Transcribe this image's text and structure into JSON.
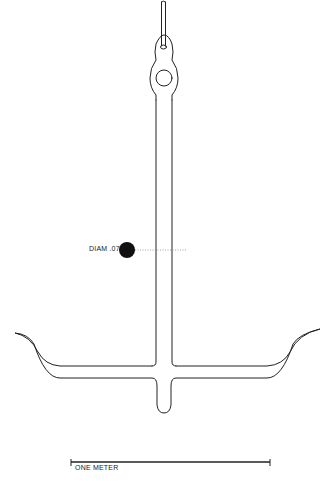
{
  "figure": {
    "line_color": "#222222",
    "background": "#ffffff"
  },
  "annotations": {
    "diameter_label": "DIAM .07",
    "scale_label": "ONE METER"
  }
}
